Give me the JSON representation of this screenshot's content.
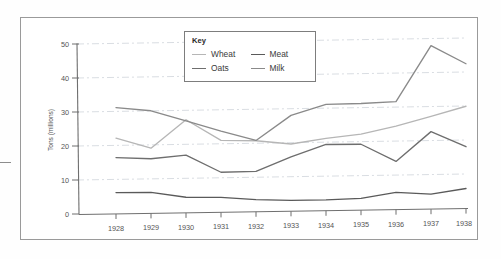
{
  "chart_data": {
    "type": "line",
    "title": "",
    "xlabel": "",
    "ylabel": "Tons (millions)",
    "x": [
      1928,
      1929,
      1930,
      1931,
      1932,
      1933,
      1934,
      1935,
      1936,
      1937,
      1938
    ],
    "xtick_labels": [
      "1928",
      "1929",
      "1930",
      "1931",
      "1932",
      "1933",
      "1934",
      "1935",
      "1936",
      "1937",
      "1938"
    ],
    "ytick_labels": [
      "0",
      "10",
      "20",
      "30",
      "40",
      "50"
    ],
    "yticks": [
      0,
      10,
      20,
      30,
      40,
      50
    ],
    "ylim": [
      0,
      50
    ],
    "grid": "horizontal-dashed",
    "legend_position": "top-center-inset",
    "legend_title": "Key",
    "series": [
      {
        "name": "Wheat",
        "color": "#b6b6b6",
        "values": [
          22.3,
          19.2,
          27.4,
          21.2,
          20.9,
          19.8,
          21.3,
          22.4,
          24.6,
          27.3,
          30.1
        ]
      },
      {
        "name": "Oats",
        "color": "#6e6e6e",
        "values": [
          16.6,
          16.1,
          17.0,
          11.8,
          11.9,
          16.0,
          19.5,
          19.4,
          14.2,
          22.8,
          18.2
        ]
      },
      {
        "name": "Meat",
        "color": "#5a5a5a",
        "values": [
          6.3,
          6.2,
          4.6,
          4.4,
          3.6,
          3.2,
          3.2,
          3.5,
          5.1,
          4.4,
          5.9
        ]
      },
      {
        "name": "Milk",
        "color": "#8a8a8a",
        "values": [
          31.3,
          30.2,
          27.1,
          23.9,
          21.0,
          28.2,
          31.3,
          31.4,
          31.8,
          48.1,
          42.6
        ]
      }
    ]
  },
  "legend": {
    "title": "Key",
    "rows": [
      [
        {
          "label": "Wheat",
          "color": "#b6b6b6"
        },
        {
          "label": "Meat",
          "color": "#5a5a5a"
        }
      ],
      [
        {
          "label": "Oats",
          "color": "#6e6e6e"
        },
        {
          "label": "Milk",
          "color": "#8a8a8a"
        }
      ]
    ]
  },
  "axes": {
    "y_title": "Tons (millions)",
    "y_labels": [
      "50",
      "40",
      "30",
      "20",
      "10",
      "0"
    ],
    "x_labels": [
      "1928",
      "1929",
      "1930",
      "1931",
      "1932",
      "1933",
      "1934",
      "1935",
      "1936",
      "1937",
      "1938"
    ]
  }
}
